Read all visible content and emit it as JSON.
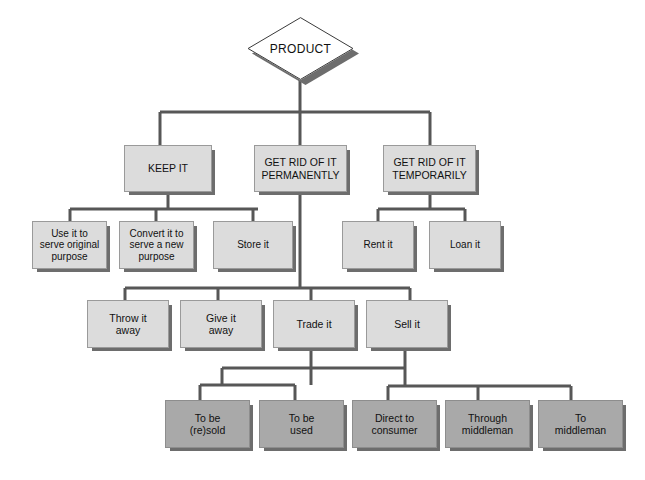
{
  "diagram": {
    "title": "PRODUCT",
    "root": {
      "name": "product-root",
      "label": "PRODUCT",
      "shape": "diamond",
      "x": 247,
      "y": 17,
      "w": 107,
      "h": 63
    },
    "levels": [
      {
        "name": "level-2",
        "fontClass": "lvl2",
        "tone": "light",
        "nodes": [
          {
            "name": "node-keep-it",
            "label": "KEEP IT",
            "x": 124,
            "y": 145,
            "w": 88,
            "h": 47
          },
          {
            "name": "node-get-rid-permanently",
            "label": "GET RID OF IT\nPERMANENTLY",
            "x": 254,
            "y": 145,
            "w": 93,
            "h": 47
          },
          {
            "name": "node-get-rid-temporarily",
            "label": "GET RID OF IT\nTEMPORARILY",
            "x": 383,
            "y": 145,
            "w": 93,
            "h": 47
          }
        ]
      },
      {
        "name": "level-3",
        "fontClass": "lvl3",
        "tone": "light",
        "nodes": [
          {
            "name": "node-use-original-purpose",
            "label": "Use it to\nserve original\npurpose",
            "x": 32,
            "y": 221,
            "w": 75,
            "h": 48
          },
          {
            "name": "node-convert-new-purpose",
            "label": "Convert it to\nserve a new\npurpose",
            "x": 119,
            "y": 221,
            "w": 75,
            "h": 48
          },
          {
            "name": "node-store-it",
            "label": "Store it",
            "x": 213,
            "y": 221,
            "w": 80,
            "h": 48
          },
          {
            "name": "node-rent-it",
            "label": "Rent it",
            "x": 342,
            "y": 221,
            "w": 72,
            "h": 48
          },
          {
            "name": "node-loan-it",
            "label": "Loan it",
            "x": 429,
            "y": 221,
            "w": 72,
            "h": 48
          }
        ]
      },
      {
        "name": "level-4",
        "fontClass": "lvl4",
        "tone": "light",
        "nodes": [
          {
            "name": "node-throw-it-away",
            "label": "Throw it\naway",
            "x": 87,
            "y": 300,
            "w": 82,
            "h": 48
          },
          {
            "name": "node-give-it-away",
            "label": "Give it\naway",
            "x": 180,
            "y": 300,
            "w": 82,
            "h": 48
          },
          {
            "name": "node-trade-it",
            "label": "Trade it",
            "x": 273,
            "y": 300,
            "w": 82,
            "h": 48
          },
          {
            "name": "node-sell-it",
            "label": "Sell it",
            "x": 366,
            "y": 300,
            "w": 82,
            "h": 48
          }
        ]
      },
      {
        "name": "level-5",
        "fontClass": "lvl5",
        "tone": "dark",
        "nodes": [
          {
            "name": "node-to-be-resold",
            "label": "To be\n(re)sold",
            "x": 165,
            "y": 400,
            "w": 85,
            "h": 48
          },
          {
            "name": "node-to-be-used",
            "label": "To be\nused",
            "x": 259,
            "y": 400,
            "w": 85,
            "h": 48
          },
          {
            "name": "node-direct-to-consumer",
            "label": "Direct to\nconsumer",
            "x": 352,
            "y": 400,
            "w": 85,
            "h": 48
          },
          {
            "name": "node-through-middleman",
            "label": "Through\nmiddleman",
            "x": 445,
            "y": 400,
            "w": 85,
            "h": 48
          },
          {
            "name": "node-to-middleman",
            "label": "To\nmiddleman",
            "x": 538,
            "y": 400,
            "w": 85,
            "h": 48
          }
        ]
      }
    ],
    "colors": {
      "box_fill": "#dcdcdc",
      "box_fill_dark": "#a9a9a9",
      "box_border": "#9a9a9a",
      "shadow": "#6d6d6d",
      "connector": "#575757",
      "text": "#111111",
      "background": "#ffffff"
    },
    "connectors": {
      "stroke": "#575757",
      "stroke_width": 3,
      "paths": [
        "M300,80 L300,112",
        "M160,112 L430,112",
        "M160,112 L160,145",
        "M300,112 L300,145",
        "M430,112 L430,145",
        "M168,192 L168,209",
        "M70,209 L258,209",
        "M70,209 L70,221",
        "M156,209 L156,221",
        "M253,209 L253,221",
        "M430,192 L430,209",
        "M378,209 L465,209",
        "M378,209 L378,221",
        "M465,209 L465,221",
        "M300,192 L300,288",
        "M125,288 L410,288",
        "M125,288 L125,300",
        "M218,288 L218,300",
        "M311,288 L311,300",
        "M410,288 L410,300",
        "M311,348 L311,385",
        "M222,368 L405,368",
        "M222,368 L222,385",
        "M200,385 L295,385",
        "M200,385 L200,400",
        "M295,385 L295,400",
        "M405,348 L405,386",
        "M388,386 L571,386",
        "M388,386 L388,400",
        "M478,386 L478,400",
        "M571,386 L571,400"
      ]
    }
  }
}
